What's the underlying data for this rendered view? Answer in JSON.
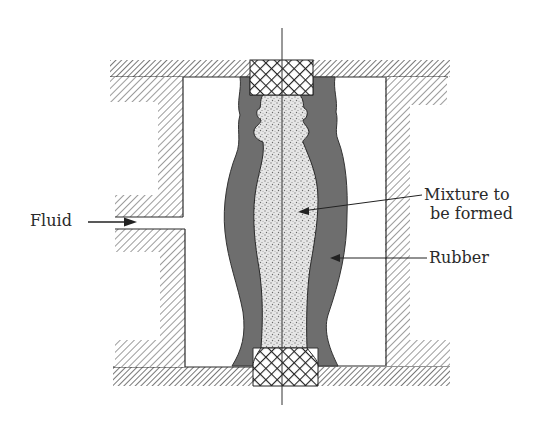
{
  "diagram": {
    "labels": {
      "fluid": "Fluid",
      "mixture_line1": "Mixture to",
      "mixture_line2": "be formed",
      "rubber": "Rubber"
    },
    "colors": {
      "background": "#ffffff",
      "rubber": "#6e6e6e",
      "mixture": "#e4e4e4",
      "hatch": "#5a5a5a",
      "outline": "#2a2a2a"
    },
    "components": [
      "top-plate",
      "bottom-plate",
      "left-container-wall",
      "right-container-wall",
      "top-plug",
      "bottom-plug",
      "rubber-bag",
      "powder-mixture",
      "center-axis",
      "fluid-inlet"
    ]
  }
}
